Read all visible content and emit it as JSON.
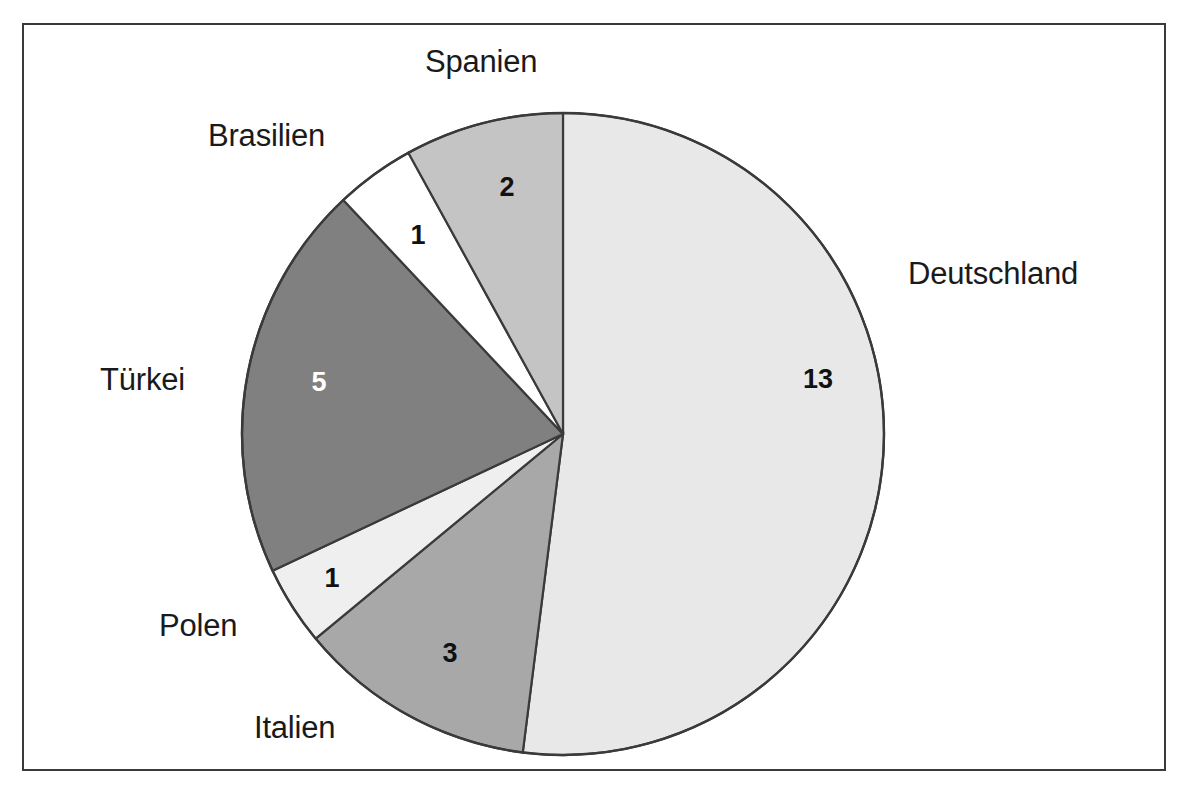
{
  "chart_data": {
    "type": "pie",
    "title": "",
    "total": 25,
    "categories": [
      "Deutschland",
      "Italien",
      "Polen",
      "Türkei",
      "Brasilien",
      "Spanien"
    ],
    "values": [
      13,
      3,
      1,
      5,
      1,
      2
    ],
    "value_labels": [
      "13",
      "3",
      "1",
      "5",
      "1",
      "2"
    ],
    "slice_colors": [
      "#e8e8e8",
      "#a8a8a8",
      "#efefef",
      "#808080",
      "#ffffff",
      "#c4c4c4"
    ],
    "label_text_colors": [
      "#111111",
      "#111111",
      "#111111",
      "#ffffff",
      "#111111",
      "#111111"
    ],
    "start_angle_deg": 0,
    "direction": "clockwise",
    "legend": "none",
    "grid": false,
    "outline_color": "#3a3a3a"
  },
  "frame": {
    "border_color": "#3a3a3a",
    "background": "#ffffff"
  },
  "labels": {
    "spanien": "Spanien",
    "brasilien": "Brasilien",
    "deutschland": "Deutschland",
    "tuerkei": "Türkei",
    "polen": "Polen",
    "italien": "Italien"
  },
  "values": {
    "spanien": "2",
    "brasilien": "1",
    "deutschland": "13",
    "tuerkei": "5",
    "polen": "1",
    "italien": "3"
  }
}
